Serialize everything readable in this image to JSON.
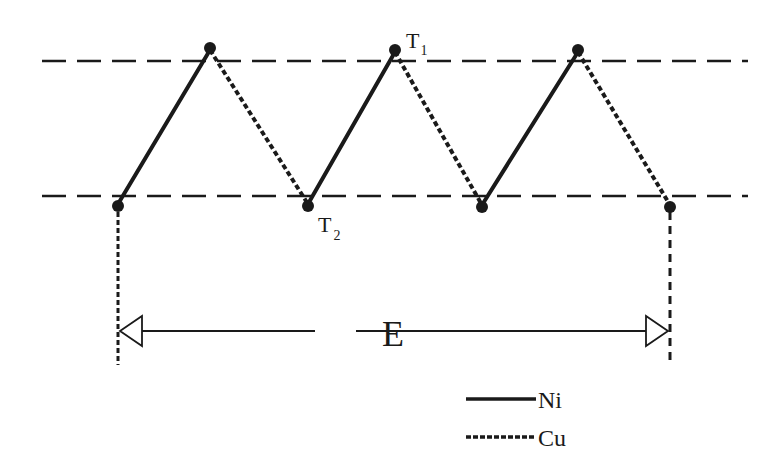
{
  "diagram": {
    "reference_lines": {
      "upper_y": 61,
      "lower_y": 196,
      "x_start": 42,
      "x_end": 748,
      "style": "dashed"
    },
    "points": [
      {
        "x": 118,
        "y": 206
      },
      {
        "x": 210,
        "y": 48
      },
      {
        "x": 308,
        "y": 206
      },
      {
        "x": 395,
        "y": 50
      },
      {
        "x": 482,
        "y": 207
      },
      {
        "x": 578,
        "y": 50
      },
      {
        "x": 670,
        "y": 207
      }
    ],
    "labels": {
      "t1": "T",
      "t1_sub": "1",
      "t2": "T",
      "t2_sub": "2",
      "dimension": "E"
    },
    "legend": [
      {
        "label": "Ni",
        "style": "solid"
      },
      {
        "label": "Cu",
        "style": "dotted"
      }
    ],
    "colors": {
      "ink": "#1a1a1a",
      "background": "#ffffff"
    }
  }
}
